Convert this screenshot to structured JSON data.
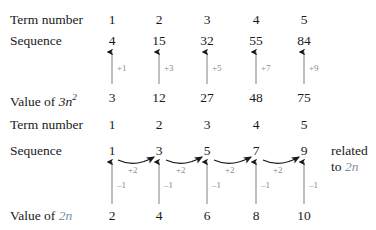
{
  "figure": {
    "columns_x": [
      112,
      159,
      207,
      256,
      304
    ],
    "accent_color": "#7e8e9e",
    "arrow_gray": "#8a8a8a",
    "arrow_black": "#1a1a1a"
  },
  "block_top": {
    "rows": [
      {
        "label": "Term number",
        "label_suffix": "",
        "values": [
          "1",
          "2",
          "3",
          "4",
          "5"
        ]
      },
      {
        "label": "Sequence",
        "label_suffix": "",
        "values": [
          "4",
          "15",
          "32",
          "55",
          "84"
        ]
      },
      {
        "label": "Value of ",
        "label_math": "3n",
        "label_sup": "2",
        "values": [
          "3",
          "12",
          "27",
          "48",
          "75"
        ]
      }
    ],
    "gap_labels": [
      "+1",
      "+3",
      "+5",
      "+7",
      "+9"
    ]
  },
  "block_bottom": {
    "rows": [
      {
        "label": "Term number",
        "values": [
          "1",
          "2",
          "3",
          "4",
          "5"
        ]
      },
      {
        "label": "Sequence",
        "values": [
          "1",
          "3",
          "5",
          "7",
          "9"
        ]
      },
      {
        "label": "Value of ",
        "label_math": "2n",
        "values": [
          "2",
          "4",
          "6",
          "8",
          "10"
        ]
      }
    ],
    "curve_labels": [
      "+2",
      "+2",
      "+2",
      "+2"
    ],
    "vertical_labels": [
      "–1",
      "–1",
      "–1",
      "–1",
      "–1"
    ]
  },
  "side_note": {
    "line1": "related",
    "line2_prefix": "to ",
    "line2_math": "2n"
  }
}
